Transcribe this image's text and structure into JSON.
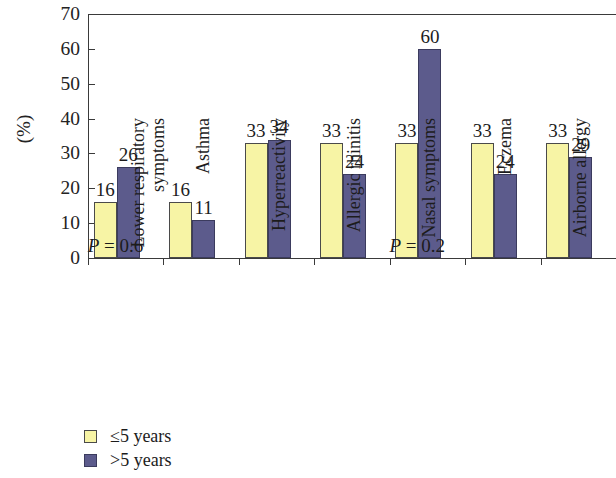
{
  "chart_data": {
    "type": "bar",
    "title": "",
    "subtitle": "",
    "xlabel": "",
    "ylabel": "(%)",
    "ylim": [
      0,
      70
    ],
    "yticks": [
      0,
      10,
      20,
      30,
      40,
      50,
      60,
      70
    ],
    "ytick_labels": [
      "0",
      "10",
      "20",
      "30",
      "40",
      "50",
      "60",
      "70"
    ],
    "grid": false,
    "legend_position": "bottom-left",
    "categories": [
      "Lower respiratory symptoms",
      "Asthma",
      "Hyperreactivity",
      "Allergic rhinitis",
      "Nasal symptoms",
      "Eczema",
      "Airborne allergy"
    ],
    "category_lines": [
      [
        "Lower respiratory",
        "symptoms"
      ],
      [
        "Asthma",
        ""
      ],
      [
        "Hyperreactivity",
        ""
      ],
      [
        "Allergic rhinitis",
        ""
      ],
      [
        "Nasal symptoms",
        ""
      ],
      [
        "Eczema",
        ""
      ],
      [
        "Airborne allergy",
        ""
      ]
    ],
    "series": [
      {
        "name": "≤5 years",
        "color": "#f7f4a5",
        "values": [
          16,
          16,
          33,
          33,
          33,
          33,
          33
        ],
        "value_labels": [
          "16",
          "16",
          "33",
          "33",
          "33",
          "33",
          "33"
        ]
      },
      {
        "name": ">5 years",
        "color": "#5c5b8c",
        "values": [
          26,
          11,
          34,
          24,
          60,
          24,
          29
        ],
        "value_labels": [
          "26",
          "11",
          "34",
          "24",
          "60",
          "24",
          "29"
        ]
      }
    ],
    "annotations": [
      {
        "text": "P = 0.6",
        "italic_prefix": "P",
        "rest": " = 0.6",
        "category_index": 0
      },
      {
        "text": "P = 0.2",
        "italic_prefix": "P",
        "rest": " = 0.2",
        "category_index": 4
      }
    ]
  },
  "legend": {
    "items": [
      {
        "label": "≤5 years",
        "color": "#f7f4a5"
      },
      {
        "label": ">5 years",
        "color": "#5c5b8c"
      }
    ]
  }
}
